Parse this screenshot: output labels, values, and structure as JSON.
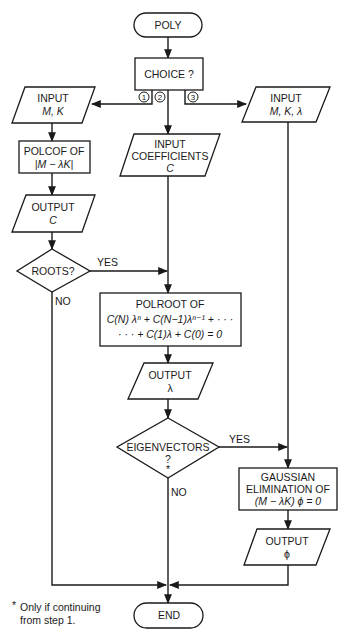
{
  "diagram": {
    "type": "flowchart",
    "nodes": {
      "start": {
        "shape": "terminator",
        "label": "POLY"
      },
      "choice": {
        "shape": "process",
        "label": "CHOICE ?"
      },
      "input_mk": {
        "shape": "io",
        "line1": "INPUT",
        "line2": "M, K"
      },
      "polcof": {
        "shape": "process",
        "line1": "POLCOF  OF",
        "line2": "|M − λK|"
      },
      "output_c": {
        "shape": "io",
        "line1": "OUTPUT",
        "line2": "C"
      },
      "roots": {
        "shape": "decision",
        "label": "ROOTS?"
      },
      "input_coeff": {
        "shape": "io",
        "line1": "INPUT",
        "line2": "COEFFICIENTS",
        "line3": "C"
      },
      "input_mkl": {
        "shape": "io",
        "line1": "INPUT",
        "line2": "M, K, λ"
      },
      "polroot": {
        "shape": "process",
        "line1": "POLROOT  OF",
        "line2": "C(N) λⁿ + C(N−1)λⁿ⁻¹ + · · ·",
        "line3": "· · · + C(1)λ + C(0) = 0"
      },
      "output_lambda": {
        "shape": "io",
        "line1": "OUTPUT",
        "line2": "λ"
      },
      "eigenvectors": {
        "shape": "decision",
        "line1": "EIGENVECTORS",
        "line2": "?",
        "line3": "*"
      },
      "gaussian": {
        "shape": "process",
        "line1": "GAUSSIAN",
        "line2": "ELIMINATION  OF",
        "line3": "(M − λK) ϕ = 0"
      },
      "output_phi": {
        "shape": "io",
        "line1": "OUTPUT",
        "line2": "ϕ"
      },
      "end": {
        "shape": "terminator",
        "label": "END"
      }
    },
    "branch_markers": [
      "1",
      "2",
      "3"
    ],
    "edge_labels": {
      "roots_yes": "YES",
      "roots_no": "NO",
      "eigen_yes": "YES",
      "eigen_no": "NO"
    },
    "edges": [
      [
        "start",
        "choice"
      ],
      [
        "choice",
        "input_mk",
        "1"
      ],
      [
        "choice",
        "input_coeff",
        "2"
      ],
      [
        "choice",
        "input_mkl",
        "3"
      ],
      [
        "input_mk",
        "polcof"
      ],
      [
        "polcof",
        "output_c"
      ],
      [
        "output_c",
        "roots"
      ],
      [
        "roots",
        "polroot",
        "YES"
      ],
      [
        "roots",
        "end",
        "NO"
      ],
      [
        "input_coeff",
        "polroot"
      ],
      [
        "polroot",
        "output_lambda"
      ],
      [
        "output_lambda",
        "eigenvectors"
      ],
      [
        "eigenvectors",
        "gaussian",
        "YES"
      ],
      [
        "eigenvectors",
        "end",
        "NO"
      ],
      [
        "input_mkl",
        "gaussian"
      ],
      [
        "gaussian",
        "output_phi"
      ],
      [
        "output_phi",
        "end"
      ]
    ],
    "footnote": {
      "line1": "Only if continuing",
      "line2": "from step 1.",
      "marker": "*"
    }
  }
}
